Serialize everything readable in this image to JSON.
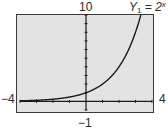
{
  "chart_data": {
    "type": "line",
    "title": "",
    "series": [
      {
        "name": "Y1 = 2^x",
        "function": "2^x",
        "x": [
          -4,
          -3,
          -2,
          -1,
          0,
          1,
          2,
          3,
          3.32
        ],
        "values": [
          0.0625,
          0.125,
          0.25,
          0.5,
          1,
          2,
          4,
          8,
          10
        ]
      }
    ],
    "xlabel": "",
    "ylabel": "",
    "xlim": [
      -4,
      4
    ],
    "ylim": [
      -1,
      10
    ],
    "xscl": 1,
    "yscl": 1,
    "grid": false,
    "axis_labels": {
      "xmin": "−4",
      "xmax": "4",
      "ymin": "−1",
      "ymax": "10"
    },
    "legend": {
      "text_prefix": "Y",
      "text_sub": "1",
      "text_mid": " = 2",
      "text_sup": "x",
      "position": "top-right"
    }
  },
  "colors": {
    "screen_bg": "#e3e3e3",
    "frame": "#3a3a3a",
    "curve": "#1a1a1a",
    "axis": "#1a1a1a"
  }
}
